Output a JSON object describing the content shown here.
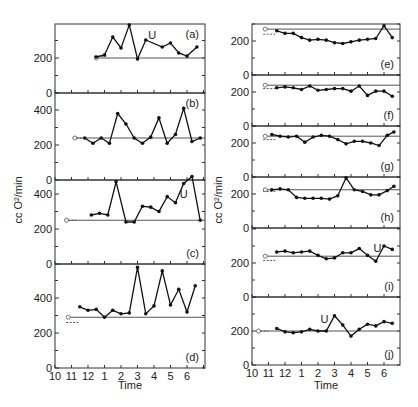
{
  "chart_data": {
    "type": "line",
    "title": "",
    "ylabel": "cc O²/min",
    "xlabel": "Time",
    "x_tick_labels": [
      "10",
      "11",
      "12",
      "1",
      "2",
      "3",
      "4",
      "5",
      "6"
    ],
    "x_range_hours_after_10": [
      0,
      9
    ],
    "panels": [
      {
        "id": "a",
        "label": "(a)",
        "column": "left",
        "ylim": [
          0,
          400
        ],
        "yticks": [
          "0",
          "200",
          "400"
        ],
        "baseline": 200,
        "baseline_start": 2.5,
        "rest_value": 210,
        "u_marker": {
          "t": 5.9,
          "v": 310,
          "text": "U"
        },
        "t": [
          2.5,
          3.0,
          3.5,
          4.0,
          4.5,
          5.0,
          5.5,
          6.5,
          7.0,
          7.5,
          8.0,
          8.6
        ],
        "v": [
          206,
          217,
          320,
          257,
          389,
          194,
          303,
          263,
          286,
          229,
          211,
          263
        ]
      },
      {
        "id": "b",
        "label": "(b)",
        "column": "left",
        "ylim": [
          0,
          400
        ],
        "yticks": [
          "0",
          "200",
          "400"
        ],
        "baseline": 240,
        "baseline_start": 1.2,
        "rest_value": 240,
        "u_marker": null,
        "t": [
          1.8,
          2.3,
          2.8,
          3.3,
          3.8,
          4.3,
          4.8,
          5.3,
          5.8,
          6.3,
          6.8,
          7.3,
          7.8,
          8.3,
          8.8
        ],
        "v": [
          240,
          210,
          240,
          210,
          380,
          320,
          240,
          210,
          245,
          355,
          210,
          260,
          410,
          220,
          240
        ]
      },
      {
        "id": "c",
        "label": "(c)",
        "column": "left",
        "ylim": [
          0,
          600
        ],
        "yticks": [
          "0",
          "200",
          "400"
        ],
        "baseline": 250,
        "baseline_start": 0.7,
        "rest_value": 250,
        "u_marker": {
          "t": 7.8,
          "v": 380,
          "text": "U"
        },
        "t": [
          2.2,
          2.7,
          3.2,
          3.7,
          4.3,
          4.8,
          5.3,
          5.8,
          6.3,
          6.8,
          7.3,
          7.8,
          8.3,
          8.8
        ],
        "v": [
          280,
          290,
          280,
          470,
          240,
          240,
          330,
          325,
          300,
          385,
          350,
          460,
          500,
          250
        ]
      },
      {
        "id": "d",
        "label": "(d)",
        "column": "left",
        "ylim": [
          0,
          600
        ],
        "yticks": [
          "0",
          "200",
          "400"
        ],
        "baseline": 290,
        "baseline_start": 0.8,
        "rest_value": 260,
        "u_marker": null,
        "t": [
          1.5,
          2.0,
          2.5,
          3.0,
          3.5,
          4.0,
          4.5,
          5.0,
          5.5,
          6.0,
          6.5,
          7.0,
          7.5,
          8.0,
          8.5
        ],
        "v": [
          350,
          330,
          335,
          290,
          330,
          310,
          315,
          575,
          310,
          355,
          555,
          360,
          450,
          320,
          470
        ]
      },
      {
        "id": "e",
        "label": "(e)",
        "column": "right",
        "ylim": [
          0,
          300
        ],
        "yticks": [
          "0",
          "200"
        ],
        "baseline": 270,
        "baseline_start": 0.8,
        "rest_value": 240,
        "u_marker": null,
        "t": [
          1.5,
          2.0,
          2.5,
          3.0,
          3.5,
          4.0,
          4.5,
          5.0,
          5.5,
          6.0,
          6.5,
          7.0,
          7.5,
          8.0,
          8.5
        ],
        "v": [
          260,
          245,
          245,
          220,
          205,
          210,
          205,
          190,
          185,
          195,
          205,
          210,
          215,
          290,
          220
        ]
      },
      {
        "id": "f",
        "label": "(f)",
        "column": "right",
        "ylim": [
          0,
          300
        ],
        "yticks": [
          "0",
          "200"
        ],
        "baseline": 240,
        "baseline_start": 0.8,
        "rest_value": 220,
        "u_marker": null,
        "t": [
          1.5,
          2.0,
          2.5,
          3.0,
          3.5,
          4.0,
          4.5,
          5.0,
          5.5,
          6.0,
          6.5,
          7.0,
          7.5,
          8.0,
          8.5
        ],
        "v": [
          225,
          230,
          225,
          215,
          235,
          210,
          215,
          220,
          220,
          205,
          235,
          180,
          205,
          205,
          175
        ]
      },
      {
        "id": "g",
        "label": "(g)",
        "column": "right",
        "ylim": [
          0,
          300
        ],
        "yticks": [
          "0",
          "200"
        ],
        "baseline": 240,
        "baseline_start": 0.8,
        "rest_value": 220,
        "u_marker": null,
        "t": [
          1.2,
          1.7,
          2.2,
          2.7,
          3.2,
          3.7,
          4.2,
          4.7,
          5.2,
          5.7,
          6.2,
          6.7,
          7.2,
          7.7,
          8.2,
          8.6
        ],
        "v": [
          250,
          240,
          235,
          240,
          205,
          235,
          245,
          240,
          220,
          195,
          210,
          210,
          200,
          185,
          245,
          265
        ]
      },
      {
        "id": "h",
        "label": "(h)",
        "column": "right",
        "ylim": [
          0,
          300
        ],
        "yticks": [
          "0",
          "200"
        ],
        "baseline": 225,
        "baseline_start": 0.8,
        "rest_value": 215,
        "u_marker": null,
        "t": [
          1.2,
          1.7,
          2.2,
          2.7,
          3.2,
          3.7,
          4.2,
          4.7,
          5.2,
          5.7,
          6.2,
          6.7,
          7.2,
          7.7,
          8.2,
          8.6
        ],
        "v": [
          225,
          230,
          225,
          180,
          175,
          175,
          175,
          170,
          190,
          295,
          225,
          215,
          195,
          195,
          220,
          245
        ]
      },
      {
        "id": "i",
        "label": "(i)",
        "column": "right",
        "ylim": [
          0,
          300
        ],
        "yticks": [
          "0",
          "200"
        ],
        "baseline": 240,
        "baseline_start": 0.8,
        "rest_value": 215,
        "u_marker": {
          "t": 7.6,
          "v": 265,
          "text": "U"
        },
        "t": [
          1.5,
          2.0,
          2.5,
          3.0,
          3.5,
          4.0,
          4.5,
          5.0,
          5.5,
          6.0,
          6.5,
          7.0,
          7.5,
          8.0,
          8.5
        ],
        "v": [
          265,
          270,
          260,
          265,
          270,
          245,
          225,
          230,
          260,
          260,
          285,
          245,
          210,
          300,
          280
        ]
      },
      {
        "id": "j",
        "label": "(j)",
        "column": "right",
        "ylim": [
          0,
          300
        ],
        "yticks": [
          "0",
          "200"
        ],
        "baseline": 200,
        "baseline_start": 0.4,
        "rest_value": 200,
        "u_marker": {
          "t": 4.4,
          "v": 250,
          "text": "U"
        },
        "t": [
          1.5,
          2.0,
          2.5,
          3.0,
          3.5,
          4.0,
          4.5,
          5.0,
          5.5,
          6.0,
          6.5,
          7.0,
          7.5,
          8.0,
          8.5
        ],
        "v": [
          215,
          195,
          190,
          195,
          210,
          200,
          200,
          290,
          235,
          170,
          210,
          240,
          230,
          255,
          245
        ]
      }
    ]
  }
}
